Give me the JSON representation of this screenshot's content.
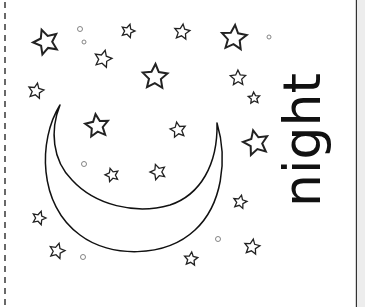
{
  "worksheet": {
    "word": "night",
    "colors": {
      "ink": "#111111",
      "star_stroke": "#222222",
      "dot_stroke": "#777777",
      "margin": "#ededed",
      "background": "#ffffff"
    },
    "moon": {
      "shape": "crescent",
      "left_tip": [
        60,
        105
      ],
      "right_tip": [
        217,
        123
      ],
      "outer_bottom": [
        135,
        253
      ],
      "inner_bottom": [
        137,
        207
      ]
    },
    "stars": [
      {
        "x": 46,
        "y": 42,
        "r": 13
      },
      {
        "x": 128,
        "y": 31,
        "r": 7
      },
      {
        "x": 103,
        "y": 59,
        "r": 9
      },
      {
        "x": 36,
        "y": 91,
        "r": 8
      },
      {
        "x": 182,
        "y": 32,
        "r": 8
      },
      {
        "x": 234,
        "y": 38,
        "r": 13
      },
      {
        "x": 155,
        "y": 77,
        "r": 13
      },
      {
        "x": 238,
        "y": 78,
        "r": 8
      },
      {
        "x": 254,
        "y": 98,
        "r": 6
      },
      {
        "x": 97,
        "y": 126,
        "r": 12
      },
      {
        "x": 178,
        "y": 130,
        "r": 8
      },
      {
        "x": 256,
        "y": 143,
        "r": 13
      },
      {
        "x": 112,
        "y": 175,
        "r": 7
      },
      {
        "x": 158,
        "y": 172,
        "r": 8
      },
      {
        "x": 39,
        "y": 218,
        "r": 7
      },
      {
        "x": 57,
        "y": 251,
        "r": 8
      },
      {
        "x": 240,
        "y": 202,
        "r": 7
      },
      {
        "x": 252,
        "y": 247,
        "r": 8
      },
      {
        "x": 191,
        "y": 259,
        "r": 7
      }
    ],
    "dots": [
      {
        "x": 80,
        "y": 29,
        "r": 2.5
      },
      {
        "x": 84,
        "y": 42,
        "r": 2
      },
      {
        "x": 269,
        "y": 37,
        "r": 2
      },
      {
        "x": 84,
        "y": 164,
        "r": 2.5
      },
      {
        "x": 83,
        "y": 257,
        "r": 2.5
      },
      {
        "x": 218,
        "y": 239,
        "r": 2.5
      }
    ]
  }
}
